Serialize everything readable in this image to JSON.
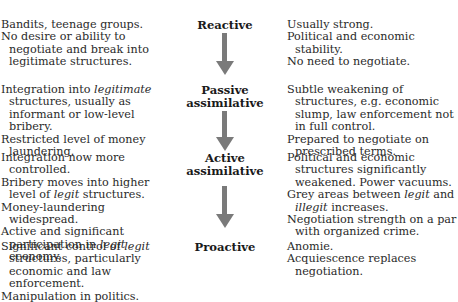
{
  "stages": [
    {
      "name": "Reactive",
      "left": [
        [
          "Bandits, teenage groups."
        ],
        [
          "No desire or ability to negotiate and break into legitimate structures."
        ]
      ],
      "right": [
        [
          "Usually strong."
        ],
        [
          "Political and economic stability."
        ],
        [
          "No need to negotiate."
        ]
      ]
    },
    {
      "name": "Passive assimilative",
      "name_lines": [
        "Passive",
        "assimilative"
      ],
      "left": [
        [
          "Integration into ",
          {
            "i": "legitimate"
          },
          " structures, usually as informant or low-level bribery."
        ],
        [
          "Restricted level of money laundering."
        ]
      ],
      "right": [
        [
          "Subtle weakening of structures, e.g. economic slump, law enforcement not in full control."
        ],
        [
          "Prepared to negotiate on prescribed terms."
        ]
      ]
    },
    {
      "name": "Active assimilative",
      "name_lines": [
        "Active",
        "assimilative"
      ],
      "left": [
        [
          "Integration now more controlled."
        ],
        [
          "Bribery moves into higher level of ",
          {
            "i": "legit"
          },
          " structures."
        ],
        [
          "Money-laundering widespread."
        ],
        [
          "Active and significant participation in ",
          {
            "i": "legit"
          },
          " economy."
        ]
      ],
      "right": [
        [
          "Political and economic structures significantly weakened. Power vacuums."
        ],
        [
          "Grey areas between ",
          {
            "i": "legit"
          },
          " and ",
          {
            "i": "illegit"
          },
          " increases."
        ],
        [
          "Negotiation strength on a par with organized crime."
        ]
      ]
    },
    {
      "name": "Proactive",
      "left": [
        [
          "Significant control of ",
          {
            "i": "legit"
          },
          " structures, particularly economic and law enforcement."
        ],
        [
          "Manipulation in politics."
        ]
      ],
      "right": [
        [
          "Anomie."
        ],
        [
          "Acquiescence replaces negotiation."
        ]
      ]
    }
  ],
  "arrow_icon": "down-arrow",
  "colors": {
    "arrow": "#7a7a7a",
    "text": "#2a2a2a"
  }
}
